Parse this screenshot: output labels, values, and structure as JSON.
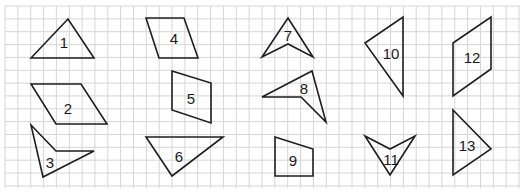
{
  "grid": {
    "x0": 5,
    "y0": 6,
    "x1": 520,
    "y1": 188,
    "spacing": 12.85,
    "line_color": "#d6d6d6"
  },
  "shapes": [
    {
      "id": "1",
      "label": "1",
      "type": "triangle",
      "points": [
        [
          31,
          58
        ],
        [
          68,
          19
        ],
        [
          94,
          58
        ]
      ],
      "label_pos": [
        64,
        42
      ]
    },
    {
      "id": "2",
      "label": "2",
      "type": "parallelogram",
      "points": [
        [
          31,
          84
        ],
        [
          81,
          84
        ],
        [
          107,
          124
        ],
        [
          56,
          124
        ]
      ],
      "label_pos": [
        68,
        108
      ]
    },
    {
      "id": "3",
      "label": "3",
      "type": "concave-quadrilateral",
      "points": [
        [
          31,
          125
        ],
        [
          56,
          151
        ],
        [
          94,
          151
        ],
        [
          43,
          177
        ]
      ],
      "label_pos": [
        50,
        162
      ]
    },
    {
      "id": "4",
      "label": "4",
      "type": "parallelogram",
      "points": [
        [
          146,
          18
        ],
        [
          184,
          18
        ],
        [
          198,
          58
        ],
        [
          159,
          58
        ]
      ],
      "label_pos": [
        174,
        38
      ]
    },
    {
      "id": "5",
      "label": "5",
      "type": "parallelogram",
      "points": [
        [
          172,
          71
        ],
        [
          211,
          83
        ],
        [
          211,
          123
        ],
        [
          172,
          110
        ]
      ],
      "label_pos": [
        191,
        98
      ]
    },
    {
      "id": "6",
      "label": "6",
      "type": "triangle",
      "points": [
        [
          146,
          137
        ],
        [
          223,
          137
        ],
        [
          172,
          176
        ]
      ],
      "label_pos": [
        179,
        156
      ]
    },
    {
      "id": "7",
      "label": "7",
      "type": "concave-quadrilateral",
      "points": [
        [
          262,
          57
        ],
        [
          288,
          18
        ],
        [
          313,
          57
        ],
        [
          288,
          44
        ]
      ],
      "label_pos": [
        288,
        35
      ]
    },
    {
      "id": "8",
      "label": "8",
      "type": "concave-quadrilateral",
      "points": [
        [
          262,
          97
        ],
        [
          312,
          71
        ],
        [
          326,
          122
        ],
        [
          301,
          97
        ]
      ],
      "label_pos": [
        304,
        88
      ]
    },
    {
      "id": "9",
      "label": "9",
      "type": "trapezoid",
      "points": [
        [
          275,
          137
        ],
        [
          313,
          149
        ],
        [
          313,
          176
        ],
        [
          275,
          176
        ]
      ],
      "label_pos": [
        293,
        160
      ]
    },
    {
      "id": "10",
      "label": "10",
      "type": "triangle",
      "points": [
        [
          365,
          43
        ],
        [
          403,
          17
        ],
        [
          403,
          96
        ]
      ],
      "label_pos": [
        391,
        53
      ]
    },
    {
      "id": "11",
      "label": "11",
      "type": "concave-quadrilateral",
      "points": [
        [
          365,
          136
        ],
        [
          390,
          149
        ],
        [
          415,
          136
        ],
        [
          390,
          175
        ]
      ],
      "label_pos": [
        391,
        159
      ]
    },
    {
      "id": "12",
      "label": "12",
      "type": "parallelogram",
      "points": [
        [
          453,
          43
        ],
        [
          491,
          17
        ],
        [
          491,
          69
        ],
        [
          453,
          96
        ]
      ],
      "label_pos": [
        472,
        57
      ]
    },
    {
      "id": "13",
      "label": "13",
      "type": "triangle",
      "points": [
        [
          453,
          110
        ],
        [
          491,
          149
        ],
        [
          453,
          175
        ]
      ],
      "label_pos": [
        467,
        145
      ]
    }
  ],
  "stroke_color": "#1e1e1e"
}
